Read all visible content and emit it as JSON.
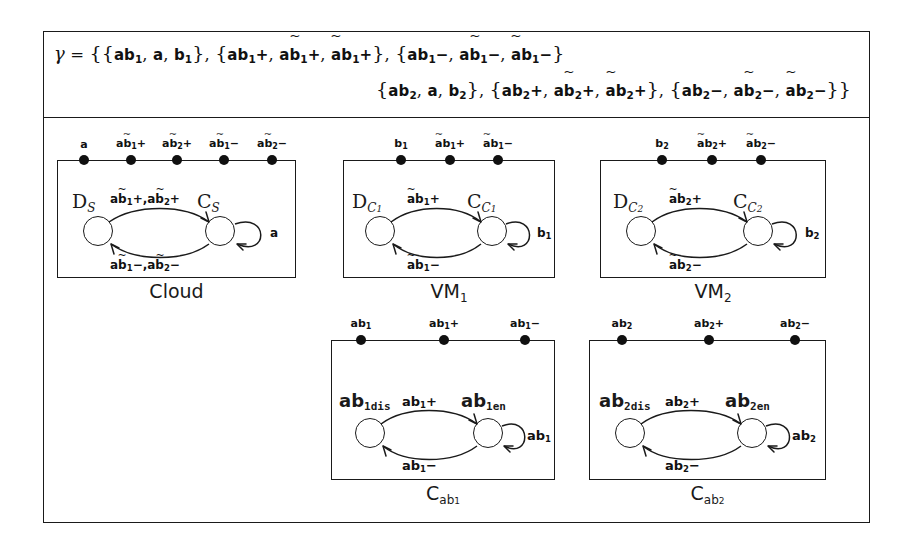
{
  "figure": {
    "formula": {
      "lhs": "γ",
      "eq": "=",
      "line1": "{{ab₁, a, b₁}, {ab₁+, ab̃₁+, ãb₁+}, {ab₁−, ab̃₁−, ãb₁−}",
      "line2": "{ab₂, a, b₂}, {ab₂+, ab̃₂+, ãb₂+}, {ab₂−, ab̃₂−, ãb₂−}}"
    },
    "components": [
      {
        "id": "cloud",
        "caption": "Cloud",
        "caption_sub": "",
        "ports": [
          {
            "label": "a",
            "sub": "",
            "tilde": "none",
            "sign": ""
          },
          {
            "label": "ab",
            "sub": "1",
            "tilde": "b",
            "sign": "+"
          },
          {
            "label": "ab",
            "sub": "2",
            "tilde": "b",
            "sign": "+"
          },
          {
            "label": "ab",
            "sub": "1",
            "tilde": "b",
            "sign": "−"
          },
          {
            "label": "ab",
            "sub": "2",
            "tilde": "b",
            "sign": "−"
          }
        ],
        "states": [
          {
            "name": "D",
            "sub": "S",
            "style": "serif"
          },
          {
            "name": "C",
            "sub": "S",
            "style": "serif"
          }
        ],
        "transitions": {
          "top": "ab̃₁+, ab̃₂+",
          "bottom": "ab̃₁−, ab̃₂−",
          "self": "a"
        }
      },
      {
        "id": "vm1",
        "caption": "VM",
        "caption_sub": "1",
        "ports": [
          {
            "label": "b",
            "sub": "1",
            "tilde": "none",
            "sign": ""
          },
          {
            "label": "ab",
            "sub": "1",
            "tilde": "a",
            "sign": "+"
          },
          {
            "label": "ab",
            "sub": "1",
            "tilde": "a",
            "sign": "−"
          }
        ],
        "states": [
          {
            "name": "D",
            "sub": "C₁",
            "style": "serif"
          },
          {
            "name": "C",
            "sub": "C₁",
            "style": "serif"
          }
        ],
        "transitions": {
          "top": "ãb₁+",
          "bottom": "ãb₁−",
          "self": "b₁"
        }
      },
      {
        "id": "vm2",
        "caption": "VM",
        "caption_sub": "2",
        "ports": [
          {
            "label": "b",
            "sub": "2",
            "tilde": "none",
            "sign": ""
          },
          {
            "label": "ab",
            "sub": "2",
            "tilde": "a",
            "sign": "+"
          },
          {
            "label": "ab",
            "sub": "2",
            "tilde": "a",
            "sign": "−"
          }
        ],
        "states": [
          {
            "name": "D",
            "sub": "C₂",
            "style": "serif"
          },
          {
            "name": "C",
            "sub": "C₂",
            "style": "serif"
          }
        ],
        "transitions": {
          "top": "ãb₂+",
          "bottom": "ãb₂−",
          "self": "b₂"
        }
      },
      {
        "id": "cab1",
        "caption": "C",
        "caption_sub": "ab₁",
        "ports": [
          {
            "label": "ab",
            "sub": "1",
            "tilde": "none",
            "sign": ""
          },
          {
            "label": "ab",
            "sub": "1",
            "tilde": "none",
            "sign": "+"
          },
          {
            "label": "ab",
            "sub": "1",
            "tilde": "none",
            "sign": "−"
          }
        ],
        "states": [
          {
            "name": "ab",
            "sub": "1dis",
            "style": "mono"
          },
          {
            "name": "ab",
            "sub": "1en",
            "style": "mono"
          }
        ],
        "transitions": {
          "top": "ab₁+",
          "bottom": "ab₁−",
          "self": "ab₁"
        }
      },
      {
        "id": "cab2",
        "caption": "C",
        "caption_sub": "ab₂",
        "ports": [
          {
            "label": "ab",
            "sub": "2",
            "tilde": "none",
            "sign": ""
          },
          {
            "label": "ab",
            "sub": "2",
            "tilde": "none",
            "sign": "+"
          },
          {
            "label": "ab",
            "sub": "2",
            "tilde": "none",
            "sign": "−"
          }
        ],
        "states": [
          {
            "name": "ab",
            "sub": "2dis",
            "style": "mono"
          },
          {
            "name": "ab",
            "sub": "2en",
            "style": "mono"
          }
        ],
        "transitions": {
          "top": "ab₂+",
          "bottom": "ab₂−",
          "self": "ab₂"
        }
      }
    ],
    "colors": {
      "ink": "#1a1a1a",
      "background": "#ffffff"
    }
  }
}
